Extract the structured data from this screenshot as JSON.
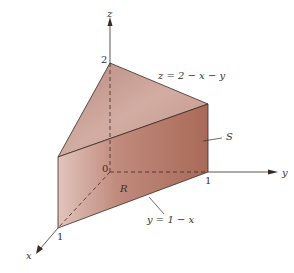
{
  "diagram": {
    "type": "3d-solid",
    "axes": {
      "x": {
        "label": "x",
        "tick": "1"
      },
      "y": {
        "label": "y",
        "tick": "1"
      },
      "z": {
        "label": "z",
        "tick": "2"
      },
      "origin": "0"
    },
    "labels": {
      "surface_eq": "z = 2 − x − y",
      "surface_name": "S",
      "region_name": "R",
      "boundary_eq": "y = 1 − x"
    },
    "colors": {
      "top_face": "#c9998c",
      "front_face": "#b47a6a",
      "right_face": "#a86a58",
      "edges": "#3a2a26"
    }
  }
}
